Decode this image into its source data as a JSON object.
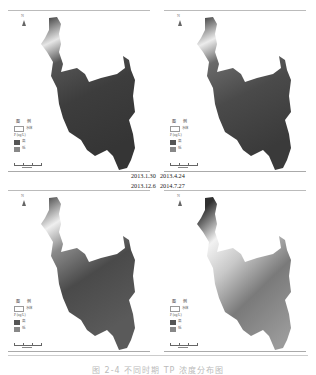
{
  "figure": {
    "caption": "图 2-4 不同时期 TP 浓度分布图",
    "panels": [
      {
        "id": "p1",
        "date": "2013.1.30",
        "gradient": [
          "#2f2f2f",
          "#3d3d3d",
          "#4a4a4a",
          "#e6e6e6",
          "#3a3a3a"
        ]
      },
      {
        "id": "p2",
        "date": "2013.4.24",
        "gradient": [
          "#2f2f2f",
          "#4a4a4a",
          "#6a6a6a",
          "#ececec",
          "#3a3a3a"
        ]
      },
      {
        "id": "p3",
        "date": "2013.12.6",
        "gradient": [
          "#3a3a3a",
          "#5a5a5a",
          "#808080",
          "#efefef",
          "#444444"
        ]
      },
      {
        "id": "p4",
        "date": "2014.7.27",
        "gradient": [
          "#666666",
          "#9a9a9a",
          "#c8c8c8",
          "#f2f2f2",
          "#303030"
        ]
      }
    ],
    "legend": {
      "title": "图 例",
      "water_label": "水体",
      "value_label": "P (ug/L)",
      "high_label": "高",
      "low_label": "低"
    },
    "north_label": "N"
  }
}
